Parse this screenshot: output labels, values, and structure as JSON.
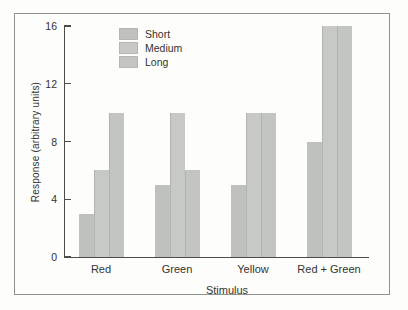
{
  "figure": {
    "background": "#fdfdfc",
    "frame_border_color": "#90928f",
    "axis_color": "#4b4c46",
    "text_color": "#33342f"
  },
  "chart_data": {
    "type": "bar",
    "title": "",
    "xlabel": "Stimulus",
    "ylabel": "Response (arbitrary units)",
    "categories": [
      "Red",
      "Green",
      "Yellow",
      "Red + Green"
    ],
    "series": [
      {
        "name": "Short",
        "values": [
          3,
          5,
          5,
          8
        ],
        "color": "#bfc1be"
      },
      {
        "name": "Medium",
        "values": [
          6,
          10,
          10,
          16
        ],
        "color": "#c7c9c6"
      },
      {
        "name": "Long",
        "values": [
          10,
          6,
          10,
          16
        ],
        "color": "#c3c5c2"
      }
    ],
    "ylim": [
      0,
      16
    ],
    "yticks": [
      0,
      4,
      8,
      12,
      16
    ],
    "grid": false,
    "legend_position": "upper-left-inside",
    "bars_per_group_touching": true
  }
}
